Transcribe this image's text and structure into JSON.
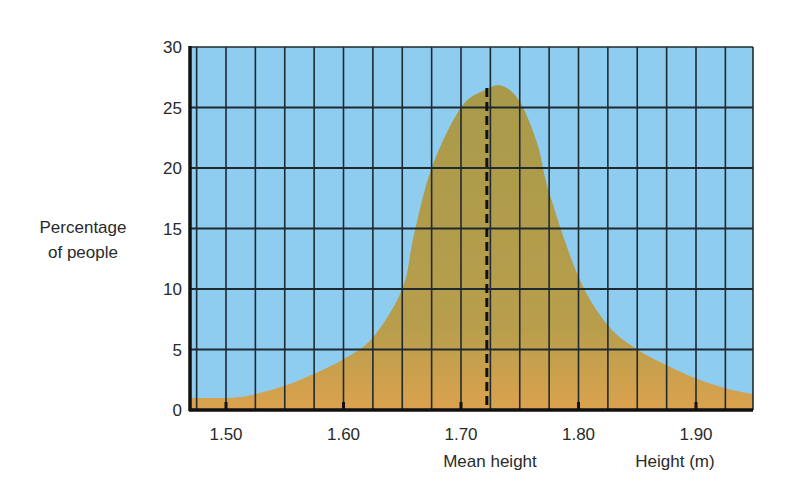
{
  "chart_data": {
    "type": "area",
    "title": "",
    "xlabel": "Height (m)",
    "ylabel": "Percentage of people",
    "xlim": [
      1.47,
      1.95
    ],
    "ylim": [
      0,
      30
    ],
    "x_ticks": [
      1.5,
      1.6,
      1.7,
      1.8,
      1.9
    ],
    "x_tick_labels": [
      "1.50",
      "1.60",
      "1.70",
      "1.80",
      "1.90"
    ],
    "y_ticks": [
      0,
      5,
      10,
      15,
      20,
      25,
      30
    ],
    "y_tick_labels": [
      "0",
      "5",
      "10",
      "15",
      "20",
      "25",
      "30"
    ],
    "grid": true,
    "x_grid_step": 0.025,
    "legend": null,
    "annotations": [
      {
        "text": "Mean height",
        "x": 1.722,
        "style": "dashed vertical line"
      }
    ],
    "series": [
      {
        "name": "Height distribution",
        "x": [
          1.47,
          1.5,
          1.52,
          1.55,
          1.575,
          1.6,
          1.625,
          1.65,
          1.66,
          1.675,
          1.7,
          1.722,
          1.735,
          1.75,
          1.765,
          1.775,
          1.8,
          1.825,
          1.85,
          1.875,
          1.9,
          1.925,
          1.95
        ],
        "values": [
          1.0,
          1.0,
          1.2,
          2.0,
          3.0,
          4.2,
          6.0,
          10.0,
          14.5,
          20.0,
          25.0,
          26.5,
          26.8,
          25.5,
          22.0,
          18.0,
          11.0,
          7.0,
          5.0,
          3.7,
          2.6,
          1.8,
          1.3
        ]
      }
    ],
    "colors": {
      "background": "#8ecdf0",
      "fill_top": "#a89a4a",
      "fill_bottom": "#d8a24e",
      "grid": "#1e2a30"
    }
  },
  "labels": {
    "ylabel_line1": "Percentage",
    "ylabel_line2": "of people",
    "mean_label": "Mean height",
    "xlabel": "Height (m)"
  }
}
